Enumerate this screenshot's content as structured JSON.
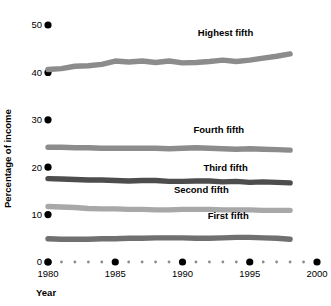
{
  "chart_data": {
    "type": "line",
    "title": "",
    "subtitle": "",
    "xlabel": "Year",
    "ylabel": "Percentage of income",
    "xlim": [
      1980,
      2000
    ],
    "ylim": [
      0,
      50
    ],
    "grid": false,
    "legend_position": "inline-right",
    "x_major_ticks": [
      1980,
      1985,
      1990,
      1995,
      2000
    ],
    "x_major_tick_labels": [
      "1980",
      "1985",
      "1990",
      "1995",
      "2000"
    ],
    "x_minor_ticks": [
      1981,
      1982,
      1983,
      1984,
      1986,
      1987,
      1988,
      1989,
      1991,
      1992,
      1993,
      1994,
      1996,
      1997,
      1998,
      1999
    ],
    "y_ticks": [
      0,
      10,
      20,
      30,
      40,
      50
    ],
    "y_tick_labels": [
      "0",
      "10",
      "20",
      "30",
      "40",
      "50"
    ],
    "x": [
      1980,
      1981,
      1982,
      1983,
      1984,
      1985,
      1986,
      1987,
      1988,
      1989,
      1990,
      1991,
      1992,
      1993,
      1994,
      1995,
      1996,
      1997,
      1998
    ],
    "series": [
      {
        "name": "Highest fifth",
        "color": "#8c8c8c",
        "label_x": 1993.2,
        "label_y": 47.6,
        "values": [
          40.6,
          40.8,
          41.3,
          41.4,
          41.7,
          42.4,
          42.2,
          42.4,
          42.1,
          42.4,
          42.0,
          42.1,
          42.3,
          42.6,
          42.3,
          42.6,
          43.0,
          43.4,
          43.9
        ]
      },
      {
        "name": "Fourth fifth",
        "color": "#8c8c8c",
        "label_x": 1992.7,
        "label_y": 27.2,
        "values": [
          24.2,
          24.2,
          24.1,
          24.1,
          24.0,
          24.0,
          24.0,
          24.0,
          24.0,
          23.9,
          24.0,
          24.1,
          24.0,
          23.9,
          23.8,
          23.9,
          23.8,
          23.7,
          23.6
        ]
      },
      {
        "name": "Third fifth",
        "color": "#4d4d4d",
        "label_x": 1993.2,
        "label_y": 19.3,
        "values": [
          17.6,
          17.5,
          17.4,
          17.3,
          17.3,
          17.2,
          17.1,
          17.2,
          17.2,
          17.0,
          17.0,
          17.1,
          17.1,
          16.9,
          17.0,
          16.8,
          16.9,
          16.8,
          16.7
        ]
      },
      {
        "name": "Second fifth",
        "color": "#a8a8a8",
        "label_x": 1991.4,
        "label_y": 14.6,
        "values": [
          11.7,
          11.6,
          11.5,
          11.3,
          11.2,
          11.2,
          11.1,
          11.1,
          11.0,
          11.0,
          11.1,
          11.1,
          11.1,
          11.0,
          11.0,
          11.0,
          10.9,
          10.9,
          10.9
        ]
      },
      {
        "name": "First fifth",
        "color": "#707070",
        "label_x": 1993.4,
        "label_y": 9.0,
        "values": [
          4.9,
          4.8,
          4.8,
          4.8,
          4.9,
          4.9,
          5.0,
          5.0,
          5.1,
          5.1,
          5.1,
          5.0,
          5.0,
          5.1,
          5.2,
          5.2,
          5.1,
          5.0,
          4.8
        ]
      }
    ]
  },
  "axis": {
    "y_title": "Percentage of income",
    "x_title": "Year"
  }
}
